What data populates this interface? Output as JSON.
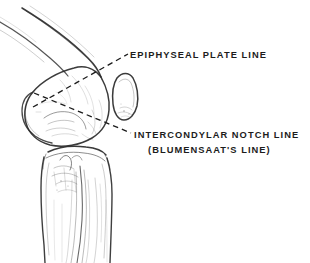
{
  "figure": {
    "background_color": "#ffffff",
    "ink_color": "#1c1c1c",
    "width": 310,
    "height": 263
  },
  "labels": {
    "epiphyseal_plate_line": "EPIPHYSEAL PLATE LINE",
    "intercondylar_notch_line": "INTERCONDYLAR NOTCH LINE",
    "blumensaat_line": "(BLUMENSAAT'S LINE)"
  },
  "anatomy": [
    {
      "name": "femur",
      "description": "distal femoral shaft and condyle"
    },
    {
      "name": "patella",
      "description": "oval sesamoid anterior to condyle"
    },
    {
      "name": "tibia",
      "description": "proximal tibia and shaft"
    }
  ],
  "reference_lines": [
    {
      "name": "epiphyseal-plate-line",
      "label_key": "epiphyseal_plate_line",
      "style": "dashed",
      "from": [
        33,
        107
      ],
      "to": [
        128,
        54
      ]
    },
    {
      "name": "intercondylar-notch-line",
      "label_key": "intercondylar_notch_line",
      "style": "dashed",
      "from": [
        34,
        93
      ],
      "to": [
        131,
        133
      ]
    }
  ]
}
